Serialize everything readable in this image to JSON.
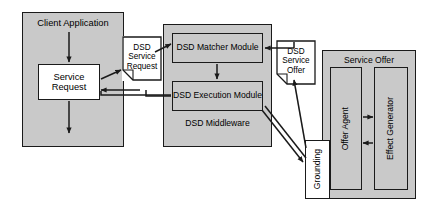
{
  "diagram": {
    "colors": {
      "fill_gray": "#c9c9c9",
      "fill_white": "#ffffff",
      "stroke": "#1a1a1a"
    },
    "containers": [
      {
        "id": "client-application",
        "label": "Client Application"
      },
      {
        "id": "dsd-middleware",
        "label": "DSD Middleware"
      },
      {
        "id": "service-offer",
        "label": "Service Offer"
      }
    ],
    "boxes": [
      {
        "id": "service-request",
        "label": "Service Request"
      },
      {
        "id": "dsd-matcher-module",
        "label": "DSD Matcher Module"
      },
      {
        "id": "dsd-execution-module",
        "label": "DSD Execution Module"
      },
      {
        "id": "offer-agent",
        "label": "Offer Agent"
      },
      {
        "id": "effect-generator",
        "label": "Effect Generator"
      },
      {
        "id": "grounding",
        "label": "Grounding"
      }
    ],
    "notes": [
      {
        "id": "dsd-service-request",
        "line1": "DSD",
        "line2": "Service",
        "line3": "Request"
      },
      {
        "id": "dsd-service-offer",
        "line1": "DSD",
        "line2": "Service",
        "line3": "Offer"
      }
    ]
  }
}
